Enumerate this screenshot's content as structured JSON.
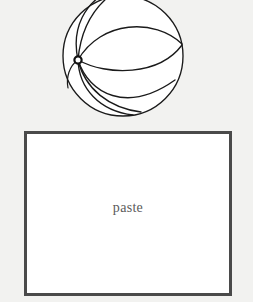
{
  "page": {
    "background_color": "#f2f2f0",
    "width": 253,
    "height": 302
  },
  "figure": {
    "name": "sphere-with-great-circles",
    "stroke_color": "#1a1a1a",
    "fill_color": "#ffffff",
    "center_x": 68,
    "center_y": 64,
    "radius": 60,
    "node_x": 23,
    "node_y": 68,
    "node_label": ""
  },
  "paste_box": {
    "label": "paste",
    "border_color": "#4a4a4a",
    "fill_color": "#ffffff",
    "text_color": "#5a5a5a",
    "border_width": "3"
  }
}
